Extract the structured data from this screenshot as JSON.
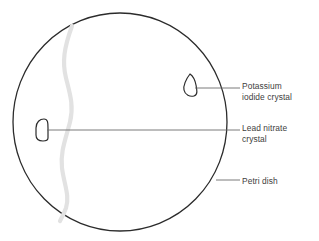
{
  "figure": {
    "background_color": "#ffffff"
  },
  "dish": {
    "name": "Petri dish",
    "outline_color": "#2b2b2b",
    "outline_width": 1.3,
    "center_x": 120,
    "center_y": 122,
    "radius_x": 107,
    "radius_y": 109
  },
  "precipitate_band": {
    "name": "precipitate band",
    "color": "#e2e2e2",
    "width": 4.2,
    "description": "pale grey wavy vertical band of precipitate"
  },
  "crystals": [
    {
      "id": "potassium-iodide",
      "label": "Potassium\niodide crystal",
      "shape": "teardrop",
      "x": 190,
      "y": 86,
      "outline_color": "#2b2b2b"
    },
    {
      "id": "lead-nitrate",
      "label": "Lead nitrate\ncrystal",
      "shape": "rounded-dome",
      "x": 41,
      "y": 130,
      "outline_color": "#2b2b2b"
    }
  ],
  "labels": [
    {
      "id": "potassium-iodide",
      "text": "Potassium\niodide crystal",
      "color": "#404040",
      "leader_from_x": 197,
      "leader_from_y": 88,
      "leader_to_x": 240,
      "leader_to_y": 88
    },
    {
      "id": "lead-nitrate",
      "text": "Lead nitrate\ncrystal",
      "color": "#404040",
      "leader_from_x": 48,
      "leader_from_y": 130,
      "leader_to_x": 240,
      "leader_to_y": 130
    },
    {
      "id": "petri-dish",
      "text": "Petri dish",
      "color": "#404040",
      "leader_from_x": 217,
      "leader_from_y": 180,
      "leader_to_x": 240,
      "leader_to_y": 180
    }
  ],
  "leader_line": {
    "color": "#6b6b6b",
    "width": 0.9
  }
}
